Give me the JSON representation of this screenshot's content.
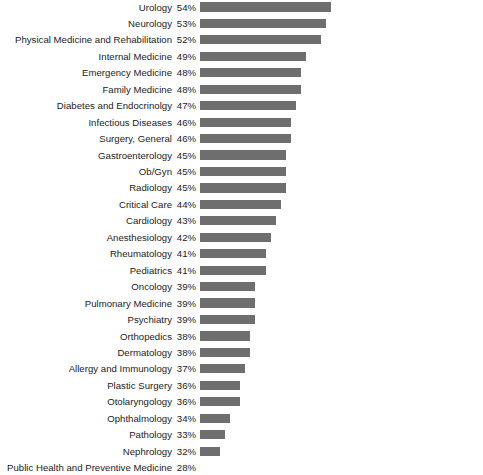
{
  "chart_data": {
    "type": "bar",
    "orientation": "horizontal",
    "title": "",
    "subtitle": "",
    "xlabel": "",
    "ylabel": "",
    "xlim": [
      0,
      60
    ],
    "grid": false,
    "legend": false,
    "value_suffix": "%",
    "bar_color": "#6e6e6e",
    "text_color": "#1b1b1b",
    "background": "#ffffff",
    "categories": [
      "Urology",
      "Neurology",
      "Physical Medicine and Rehabilitation",
      "Internal Medicine",
      "Emergency Medicine",
      "Family Medicine",
      "Diabetes and Endocrinolgy",
      "Infectious Diseases",
      "Surgery, General",
      "Gastroenterology",
      "Ob/Gyn",
      "Radiology",
      "Critical Care",
      "Cardiology",
      "Anesthesiology",
      "Rheumatology",
      "Pediatrics",
      "Oncology",
      "Pulmonary Medicine",
      "Psychiatry",
      "Orthopedics",
      "Dermatology",
      "Allergy and Immunology",
      "Plastic Surgery",
      "Otolaryngology",
      "Ophthalmology",
      "Pathology",
      "Nephrology",
      "Public Health and Preventive Medicine"
    ],
    "values": [
      54,
      53,
      52,
      49,
      48,
      48,
      47,
      46,
      46,
      45,
      45,
      45,
      44,
      43,
      42,
      41,
      41,
      39,
      39,
      39,
      38,
      38,
      37,
      36,
      36,
      34,
      33,
      32,
      28
    ],
    "value_labels": [
      "54%",
      "53%",
      "52%",
      "49%",
      "48%",
      "48%",
      "47%",
      "46%",
      "46%",
      "45%",
      "45%",
      "45%",
      "44%",
      "43%",
      "42%",
      "41%",
      "41%",
      "39%",
      "39%",
      "39%",
      "38%",
      "38%",
      "37%",
      "36%",
      "36%",
      "34%",
      "33%",
      "32%",
      "28%"
    ]
  }
}
